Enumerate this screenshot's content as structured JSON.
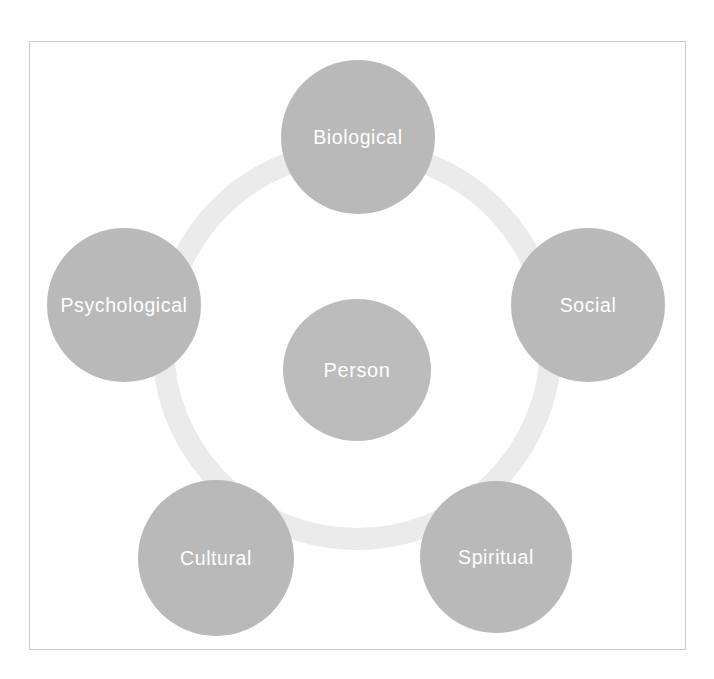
{
  "diagram": {
    "type": "cycle-hub-and-spoke",
    "title": "",
    "background_color": "#ffffff",
    "frame": {
      "name": "figure-border",
      "x": 29,
      "y": 41,
      "width": 657,
      "height": 609,
      "border_color": "#c9c9c9",
      "border_width": 1
    },
    "ring": {
      "name": "connecting-ring",
      "center_x": 357,
      "center_y": 345,
      "outer_radius": 205,
      "band_thickness": 22,
      "color": "#ebebeb"
    },
    "center_node": {
      "label": "Person",
      "center_x": 357,
      "center_y": 370,
      "radius_x": 74,
      "radius_y": 71,
      "fill_color": "#bcbcbc",
      "text_color": "#ffffff"
    },
    "outer_nodes": [
      {
        "label": "Biological",
        "center_x": 358,
        "center_y": 137,
        "radius": 77,
        "fill_color": "#b9b9b9",
        "text_color": "#ffffff"
      },
      {
        "label": "Social",
        "center_x": 588,
        "center_y": 305,
        "radius": 77,
        "fill_color": "#b9b9b9",
        "text_color": "#ffffff"
      },
      {
        "label": "Spiritual",
        "center_x": 496,
        "center_y": 557,
        "radius": 76,
        "fill_color": "#b9b9b9",
        "text_color": "#ffffff"
      },
      {
        "label": "Cultural",
        "center_x": 216,
        "center_y": 558,
        "radius": 78,
        "fill_color": "#b9b9b9",
        "text_color": "#ffffff"
      },
      {
        "label": "Psychological",
        "center_x": 124,
        "center_y": 305,
        "radius": 77,
        "fill_color": "#b9b9b9",
        "text_color": "#ffffff"
      }
    ]
  }
}
